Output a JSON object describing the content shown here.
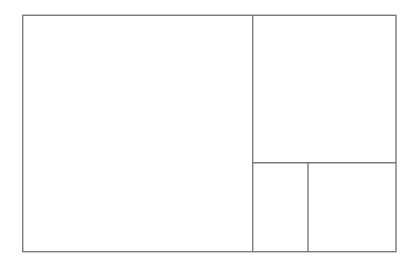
{
  "diagram": {
    "type": "rectangle-subdivision",
    "stroke_color": "#7a7a7a",
    "stroke_width": 1.4,
    "background": "#ffffff",
    "outer": {
      "x": 22.7,
      "y": 15.3,
      "width": 373.3,
      "height": 236.4
    },
    "regions": [
      {
        "id": "large-left",
        "x": 22.7,
        "y": 15.3,
        "width": 230.0,
        "height": 236.4
      },
      {
        "id": "top-right",
        "x": 252.7,
        "y": 15.3,
        "width": 143.3,
        "height": 147.4
      },
      {
        "id": "bottom-right-left",
        "x": 252.7,
        "y": 162.7,
        "width": 55.3,
        "height": 89.0
      },
      {
        "id": "bottom-right-right",
        "x": 308.0,
        "y": 162.7,
        "width": 88.0,
        "height": 89.0
      }
    ],
    "dividers": [
      {
        "id": "main-vertical",
        "x1": 252.7,
        "y1": 15.3,
        "x2": 252.7,
        "y2": 251.7
      },
      {
        "id": "right-horizontal",
        "x1": 252.7,
        "y1": 162.7,
        "x2": 396.0,
        "y2": 162.7
      },
      {
        "id": "bottom-vertical",
        "x1": 308.0,
        "y1": 162.7,
        "x2": 308.0,
        "y2": 251.7
      }
    ]
  }
}
